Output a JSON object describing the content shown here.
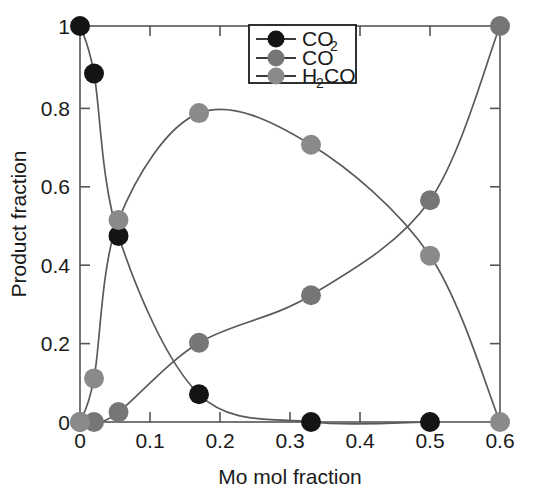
{
  "chart_data": {
    "type": "line",
    "title": "",
    "subtitle": "",
    "xlabel": "Mo mol fraction",
    "ylabel": "Product fraction",
    "xlim": [
      0,
      0.6
    ],
    "ylim": [
      0,
      1
    ],
    "xticks": [
      0,
      0.1,
      0.2,
      0.3,
      0.4,
      0.5,
      0.6
    ],
    "xticklabels": [
      "0",
      "0.1",
      "0.2",
      "0.3",
      "0.4",
      "0.5",
      "0.6"
    ],
    "yticks": [
      0,
      0.2,
      0.4,
      0.6,
      0.8,
      1
    ],
    "yticklabels": [
      "0",
      "0.2",
      "0.4",
      "0.6",
      "0.8",
      "1"
    ],
    "grid": false,
    "legend_position": "top-center",
    "markers": "filled-circle",
    "series": [
      {
        "name": "CO2",
        "legend_label": "CO",
        "legend_sub": "2",
        "color": "#141414",
        "x": [
          0,
          0.02,
          0.055,
          0.17,
          0.33,
          0.5
        ],
        "y": [
          1.0,
          0.88,
          0.47,
          0.07,
          0.0,
          0.0
        ]
      },
      {
        "name": "CO",
        "legend_label": "CO",
        "legend_sub": "",
        "color": "#767676",
        "x": [
          0,
          0.02,
          0.055,
          0.17,
          0.33,
          0.5,
          0.6
        ],
        "y": [
          0.0,
          0.0,
          0.025,
          0.2,
          0.32,
          0.56,
          1.0
        ]
      },
      {
        "name": "H2CO",
        "legend_label": "H",
        "legend_sub": "2",
        "legend_label2": "CO",
        "color": "#8a8a8a",
        "x": [
          0,
          0.02,
          0.055,
          0.17,
          0.33,
          0.5,
          0.6
        ],
        "y": [
          0.0,
          0.11,
          0.51,
          0.78,
          0.7,
          0.42,
          0.0
        ]
      }
    ]
  },
  "axes": {
    "x_title": "Mo mol fraction",
    "y_title": "Product fraction"
  },
  "legend": {
    "entries": [
      {
        "id": "co2",
        "label": "CO",
        "sub": "2",
        "tail": "",
        "color": "#141414"
      },
      {
        "id": "co",
        "label": "CO",
        "sub": "",
        "tail": "",
        "color": "#767676"
      },
      {
        "id": "h2co",
        "label": "H",
        "sub": "2",
        "tail": "CO",
        "color": "#8a8a8a"
      }
    ]
  },
  "colors": {
    "co2": "#141414",
    "co": "#767676",
    "h2co": "#8a8a8a",
    "axis": "#555555",
    "text": "#1a1a1a",
    "background": "#ffffff"
  }
}
